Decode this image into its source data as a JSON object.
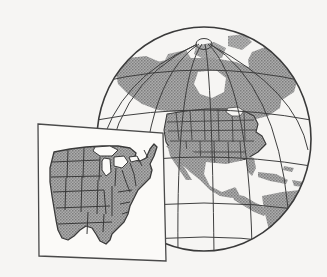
{
  "figure": {
    "name": "globe-with-us-inset-map",
    "background_color": "#f6f5f3",
    "ink_color": "#3a3a3a",
    "land_fill_color": "#9a9a9a",
    "water_fill_color": "#f6f5f3",
    "card_fill_color": "#fbfaf8",
    "card_border_color": "#4a4a4a",
    "graticule_color": "#3f3f3f"
  },
  "globe": {
    "name": "wireframe-globe",
    "center_x": 204,
    "center_y": 139,
    "radius_x": 107,
    "radius_y": 112,
    "outline_stroke_width": 1.6,
    "graticule_stroke_width": 1.0,
    "meridian_count": 8,
    "parallel_count": 5,
    "pole_marker": {
      "name": "north-pole-convergence",
      "x": 204,
      "y": 44,
      "radius": 8
    },
    "landmasses": [
      "greenland",
      "canada-arctic-archipelago",
      "alaska",
      "canada",
      "contiguous-united-states",
      "mexico",
      "central-america",
      "caribbean-islands",
      "cuba",
      "northern-south-america"
    ]
  },
  "inset_card": {
    "name": "inset-map-card",
    "corners": {
      "top_left_x": 38,
      "top_left_y": 124,
      "top_right_x": 163,
      "top_right_y": 133,
      "bottom_right_x": 166,
      "bottom_right_y": 261,
      "bottom_left_x": 39,
      "bottom_left_y": 256
    },
    "border_width": 1.3,
    "map_subject": "central-and-eastern-united-states",
    "shows_state_boundaries": true,
    "great_lakes_rendered": true
  },
  "rendering": {
    "style": "halftone-line-art",
    "source_medium": "scanned-print",
    "stroke_color": "#3a3a3a"
  }
}
